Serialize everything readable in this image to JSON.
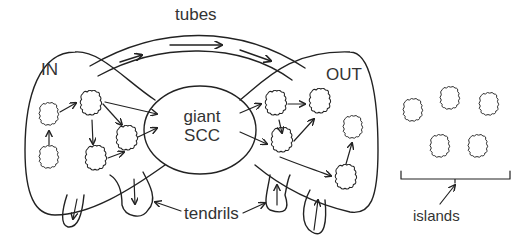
{
  "diagram": {
    "labels": {
      "tubes": "tubes",
      "in": "IN",
      "out": "OUT",
      "giant_line1": "giant",
      "giant_line2": "SCC",
      "tendrils": "tendrils",
      "islands": "islands"
    },
    "regions": [
      "IN",
      "giant SCC",
      "OUT",
      "tubes",
      "tendrils",
      "islands"
    ],
    "colors": {
      "stroke": "#222222",
      "text": "#333333",
      "background": "#ffffff"
    }
  }
}
